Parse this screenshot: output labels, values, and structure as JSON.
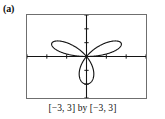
{
  "figure": {
    "part_label": "(a)",
    "caption": "[−3, 3] by [−3, 3]",
    "frame_color": "#6f6f6f",
    "curve_color": "#141414",
    "axis_color": "#141414",
    "background": "#ffffff"
  },
  "chart_data": {
    "type": "line",
    "plot_kind": "polar-rose",
    "title": "(a)",
    "subtitle": "[−3, 3] by [−3, 3]",
    "equation": "r = 2 sin(3θ)",
    "xlabel": "",
    "ylabel": "",
    "xlim": [
      -3,
      3
    ],
    "ylim": [
      -3,
      3
    ],
    "grid": false,
    "legend": null,
    "axes": {
      "x_axis_visible": true,
      "y_axis_visible": true,
      "tick_spacing": 1,
      "x_ticks": [
        -3,
        -2,
        -1,
        1,
        2,
        3
      ],
      "y_ticks": [
        -3,
        -2,
        -1,
        1,
        2,
        3
      ],
      "tick_labels_visible": false,
      "origin": [
        0,
        0
      ]
    },
    "petals": [
      {
        "name": "upper-left-petal",
        "tip_angle_deg": 150,
        "tip_radius": 2.0,
        "tip_xy": [
          -1.73,
          1.0
        ]
      },
      {
        "name": "upper-right-petal",
        "tip_angle_deg": 30,
        "tip_radius": 2.0,
        "tip_xy": [
          1.73,
          1.0
        ]
      },
      {
        "name": "lower-petal",
        "tip_angle_deg": 270,
        "tip_radius": 2.0,
        "tip_xy": [
          0.0,
          -2.0
        ]
      }
    ],
    "petal_count": 3,
    "max_radius": 2.0,
    "theta_range_deg": [
      0,
      360
    ]
  }
}
